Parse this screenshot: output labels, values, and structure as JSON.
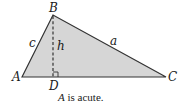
{
  "diagram": {
    "type": "triangle",
    "fill_color": "#d6d6d6",
    "stroke_color": "#333333",
    "vertices": {
      "A": {
        "label": "A",
        "x": 22,
        "y": 77
      },
      "B": {
        "label": "B",
        "x": 53,
        "y": 15
      },
      "C": {
        "label": "C",
        "x": 166,
        "y": 77
      },
      "D": {
        "label": "D",
        "x": 53,
        "y": 77
      }
    },
    "sides": {
      "a": "a",
      "c": "c"
    },
    "altitude": {
      "label": "h",
      "style": "dashed",
      "right_angle_marker": true
    },
    "caption": {
      "variable": "A",
      "text": " is acute."
    }
  }
}
